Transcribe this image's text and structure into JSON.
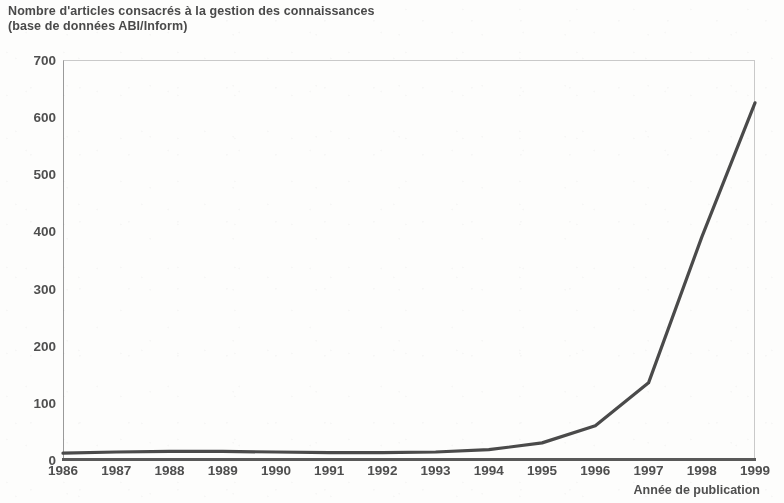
{
  "title": {
    "line1": "Nombre d'articles consacrés à la gestion des connaissances",
    "line2": "(base de données ABI/Inform)"
  },
  "axis_title_x": "Année de publication",
  "colors": {
    "line": "#4a4a4a",
    "axis": "#595959",
    "text": "#4f4f4f",
    "background": "#fdfdfc"
  },
  "chart_data": {
    "type": "line",
    "title": "Nombre d'articles consacrés à la gestion des connaissances (base de données ABI/Inform)",
    "xlabel": "Année de publication",
    "ylabel": "",
    "categories": [
      "1986",
      "1987",
      "1988",
      "1989",
      "1990",
      "1991",
      "1992",
      "1993",
      "1994",
      "1995",
      "1996",
      "1997",
      "1998",
      "1999"
    ],
    "x": [
      1986,
      1987,
      1988,
      1989,
      1990,
      1991,
      1992,
      1993,
      1994,
      1995,
      1996,
      1997,
      1998,
      1999
    ],
    "values": [
      12,
      14,
      15,
      15,
      14,
      13,
      13,
      14,
      18,
      30,
      60,
      135,
      390,
      625
    ],
    "series": [
      {
        "name": "Nombre d'articles",
        "values": [
          12,
          14,
          15,
          15,
          14,
          13,
          13,
          14,
          18,
          30,
          60,
          135,
          390,
          625
        ]
      }
    ],
    "ylim": [
      0,
      700
    ],
    "yticks": [
      0,
      100,
      200,
      300,
      400,
      500,
      600,
      700
    ],
    "ytick_labels": [
      "0",
      "100",
      "200",
      "300",
      "400",
      "500",
      "600",
      "700"
    ],
    "xlim": [
      1986,
      1999
    ],
    "grid": false,
    "legend": false
  }
}
